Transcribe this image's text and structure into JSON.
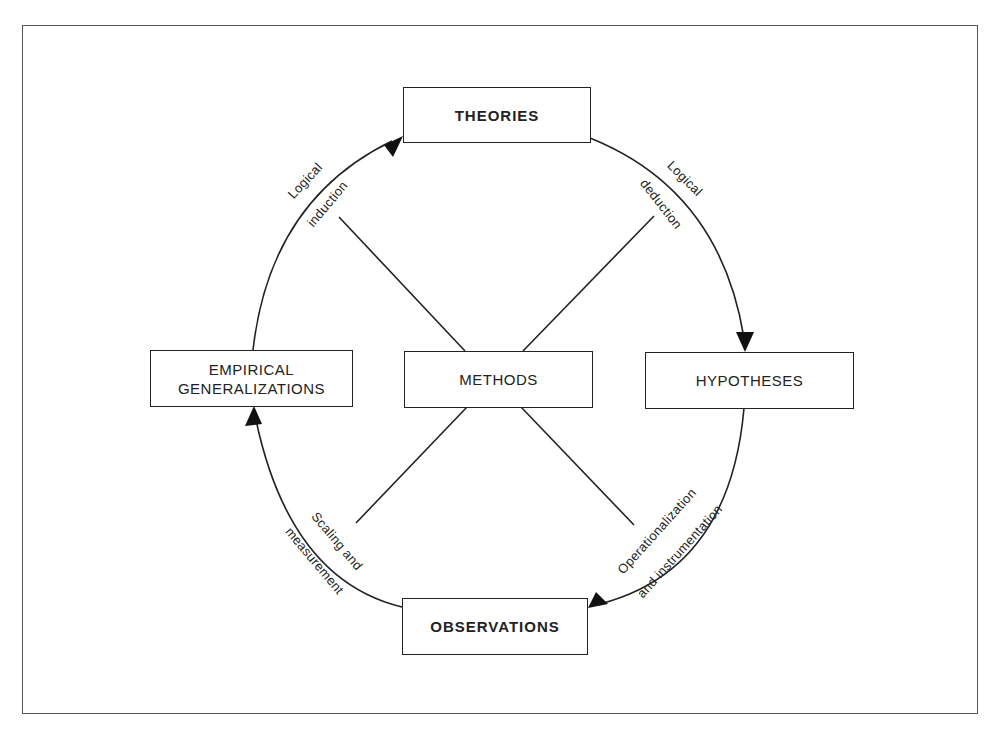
{
  "diagram": {
    "type": "research-cycle",
    "nodes": {
      "theories": "THEORIES",
      "hypotheses": "HYPOTHESES",
      "observations": "OBSERVATIONS",
      "empirical_line1": "EMPIRICAL",
      "empirical_line2": "GENERALIZATIONS",
      "methods": "METHODS"
    },
    "edges": {
      "deduction": {
        "line1": "Logical",
        "line2": "deduction",
        "from": "THEORIES",
        "to": "HYPOTHESES"
      },
      "operationalization": {
        "line1": "Operationalization",
        "line2": "and instrumentation",
        "from": "HYPOTHESES",
        "to": "OBSERVATIONS"
      },
      "scaling": {
        "line1": "Scaling and",
        "line2": "measurement",
        "from": "OBSERVATIONS",
        "to": "EMPIRICAL GENERALIZATIONS"
      },
      "induction": {
        "line1": "Logical",
        "line2": "induction",
        "from": "EMPIRICAL GENERALIZATIONS",
        "to": "THEORIES"
      }
    },
    "colors": {
      "stroke": "#222222",
      "background": "#ffffff"
    }
  }
}
